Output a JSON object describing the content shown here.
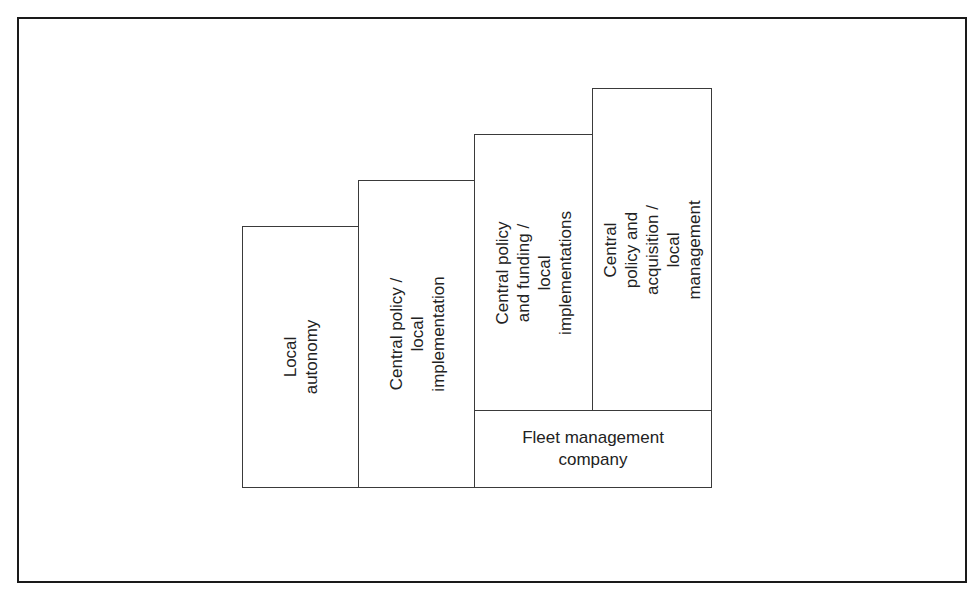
{
  "diagram": {
    "type": "staircase",
    "stages": [
      {
        "id": "local-autonomy",
        "label": "Local autonomy"
      },
      {
        "id": "central-policy-local-implementation",
        "label": "Central policy /\nlocal implementation"
      },
      {
        "id": "central-policy-funding-local-implementations",
        "label": "Central policy\nand funding /\nlocal implementations"
      },
      {
        "id": "central-policy-acquisition-local-management",
        "label": "Central policy and\nacquisition / local\nmanagement"
      }
    ],
    "base": {
      "id": "fleet-management-company",
      "label": "Fleet management\ncompany"
    },
    "colors": {
      "border": "#3a3a3a",
      "frame": "#1a1a1a",
      "background": "#ffffff",
      "text": "#222222"
    }
  }
}
